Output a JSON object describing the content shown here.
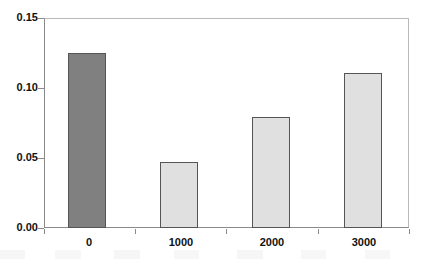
{
  "chart_data": {
    "type": "bar",
    "title": "",
    "subtitle": "",
    "xlabel": "",
    "ylabel": "",
    "categories": [
      "0",
      "1000",
      "2000",
      "3000"
    ],
    "values": [
      0.125,
      0.047,
      0.079,
      0.111
    ],
    "series": [
      {
        "name": "",
        "values": [
          0.125,
          0.047,
          0.079,
          0.111
        ]
      }
    ],
    "ylim": [
      0.0,
      0.15
    ],
    "ytick_labels": [
      "0.00",
      "0.05",
      "0.10",
      "0.15"
    ],
    "ytick_values": [
      0.0,
      0.05,
      0.1,
      0.15
    ],
    "xtick_labels": [
      "0",
      "1000",
      "2000",
      "3000"
    ],
    "grid": false,
    "legend": false,
    "legend_position": "none",
    "bar_colors": [
      "#808080",
      "#e0e0e0",
      "#e0e0e0",
      "#e0e0e0"
    ],
    "bar_border_color": "#555555",
    "frame_color": "#8a8a8a",
    "background_color": "#ffffff",
    "text_color": "#111111"
  }
}
